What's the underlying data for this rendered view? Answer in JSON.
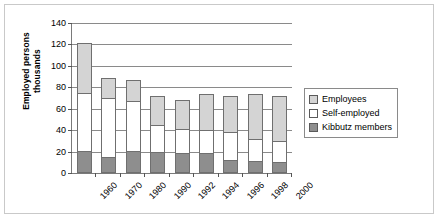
{
  "chart_data": {
    "type": "bar",
    "subtype": "stacked-vertical",
    "title": "",
    "xlabel": "",
    "ylabel": "Employed persons thousands",
    "ylabel_lines": [
      "Employed persons",
      "thousands"
    ],
    "ylim": [
      0,
      140
    ],
    "ytick_step": 20,
    "ytick_labels": [
      "140",
      "120",
      "100",
      "80",
      "60",
      "40",
      "20",
      "0"
    ],
    "ytick_values": [
      140,
      120,
      100,
      80,
      60,
      40,
      20,
      0
    ],
    "grid": true,
    "grid_axis": "y",
    "legend_position": "right",
    "categories": [
      "1960",
      "1970",
      "1980",
      "1990",
      "1992",
      "1994",
      "1996",
      "1998",
      "2000"
    ],
    "series": [
      {
        "name": "Kibbutz members",
        "color": "#8e8e8e",
        "values": [
          21,
          15,
          21,
          20,
          19,
          19,
          12,
          11,
          10
        ]
      },
      {
        "name": "Self-employed",
        "color": "#ffffff",
        "values": [
          54,
          55,
          46,
          25,
          22,
          21,
          26,
          21,
          20
        ]
      },
      {
        "name": "Employees",
        "color": "#d4d4d4",
        "values": [
          46,
          19,
          20,
          27,
          27,
          34,
          34,
          42,
          42
        ]
      }
    ],
    "totals": [
      121,
      89,
      87,
      72,
      68,
      74,
      72,
      74,
      72
    ]
  },
  "legend": {
    "items": [
      {
        "label": "Employees",
        "color": "#d4d4d4"
      },
      {
        "label": "Self-employed",
        "color": "#ffffff"
      },
      {
        "label": "Kibbutz members",
        "color": "#8e8e8e"
      }
    ]
  },
  "colors": {
    "employees": "#d4d4d4",
    "self_employed": "#ffffff",
    "kibbutz_members": "#8e8e8e",
    "axis": "#7a7a7a",
    "gridline": "#8a8a8a",
    "frame": "#c9c9c9"
  }
}
